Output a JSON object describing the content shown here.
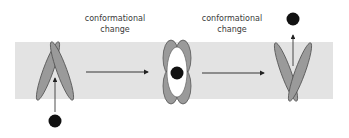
{
  "diagram": {
    "type": "conformational-change-transport",
    "colors": {
      "membrane": "#e3e3e3",
      "protein": "#9a9a9a",
      "protein_outline": "#555555",
      "molecule": "#111111",
      "arrow": "#222222",
      "pore": "#ffffff",
      "text": "#3a3a3a"
    },
    "labels": [
      {
        "id": "step1",
        "line1": "conformational",
        "line2": "change"
      },
      {
        "id": "step2",
        "line1": "conformational",
        "line2": "change"
      }
    ],
    "states": [
      {
        "id": "open-outward",
        "description": "Transporter open to bottom side; molecule approaching from below"
      },
      {
        "id": "occluded",
        "description": "Transporter closed around bound molecule"
      },
      {
        "id": "open-inward",
        "description": "Transporter open to top side; molecule released upward"
      }
    ]
  }
}
